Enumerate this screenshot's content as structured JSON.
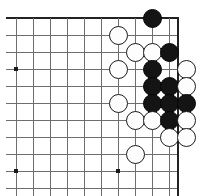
{
  "figure": {
    "kind": "go-board-diagram",
    "title": "",
    "board_region": "upper right corner",
    "geometry": {
      "width": 197,
      "height": 196,
      "origin_x": 16,
      "origin_y": 18,
      "spacing": 17,
      "cols": 10,
      "rows": 11,
      "stone_diameter": 19,
      "edge_x": 178,
      "edge_thickness": 2.6,
      "top_edge_thickness": 2.6,
      "line_thickness": 1
    },
    "colors": {
      "background": "#ffffff",
      "line": "#6e6e6e",
      "edge_line": "#222222",
      "black_stone": "#141414",
      "white_stone": "#fdfdfd",
      "white_stone_border": "#1b1b1b",
      "star_point": "#1a1a1a"
    },
    "star_points": [
      {
        "col": 0,
        "row": 3
      },
      {
        "col": 0,
        "row": 9
      },
      {
        "col": 6,
        "row": 3
      },
      {
        "col": 6,
        "row": 9
      }
    ],
    "stones": [
      {
        "color": "black",
        "col": 8,
        "row": 0,
        "label": ""
      },
      {
        "color": "white",
        "col": 6,
        "row": 1,
        "label": ""
      },
      {
        "color": "white",
        "col": 7,
        "row": 2,
        "label": ""
      },
      {
        "color": "white",
        "col": 8,
        "row": 2,
        "label": ""
      },
      {
        "color": "black",
        "col": 9,
        "row": 2,
        "label": ""
      },
      {
        "color": "white",
        "col": 6,
        "row": 3,
        "label": ""
      },
      {
        "color": "black",
        "col": 8,
        "row": 3,
        "label": ""
      },
      {
        "color": "white",
        "col": 10,
        "row": 3,
        "label": ""
      },
      {
        "color": "black",
        "col": 8,
        "row": 4,
        "label": ""
      },
      {
        "color": "black",
        "col": 9,
        "row": 4,
        "label": ""
      },
      {
        "color": "white",
        "col": 10,
        "row": 4,
        "label": ""
      },
      {
        "color": "white",
        "col": 6,
        "row": 5,
        "label": ""
      },
      {
        "color": "black",
        "col": 8,
        "row": 5,
        "label": ""
      },
      {
        "color": "black",
        "col": 9,
        "row": 5,
        "label": ""
      },
      {
        "color": "black",
        "col": 10,
        "row": 5,
        "label": ""
      },
      {
        "color": "white",
        "col": 7,
        "row": 6,
        "label": ""
      },
      {
        "color": "white",
        "col": 8,
        "row": 6,
        "label": ""
      },
      {
        "color": "black",
        "col": 9,
        "row": 6,
        "label": ""
      },
      {
        "color": "white",
        "col": 10,
        "row": 6,
        "label": ""
      },
      {
        "color": "white",
        "col": 9,
        "row": 7,
        "label": ""
      },
      {
        "color": "white",
        "col": 10,
        "row": 7,
        "label": ""
      },
      {
        "color": "white",
        "col": 7,
        "row": 8,
        "label": ""
      }
    ],
    "counts": {
      "black_stones": 9,
      "white_stones": 13,
      "total_stones": 22
    }
  }
}
